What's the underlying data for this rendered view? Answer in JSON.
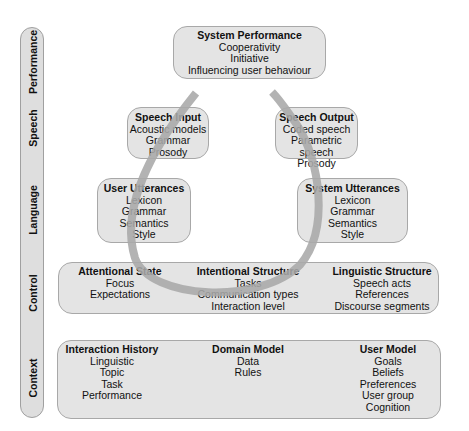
{
  "axis": {
    "levels": [
      "Performance",
      "Speech",
      "Language",
      "Control",
      "Context"
    ]
  },
  "performance": {
    "title": "System Performance",
    "items": [
      "Cooperativity",
      "Initiative",
      "Influencing user behaviour"
    ]
  },
  "speech_input": {
    "title": "Speech Input",
    "items": [
      "Acoustic models",
      "Grammar",
      "Prosody"
    ]
  },
  "speech_output": {
    "title": "Speech Output",
    "items": [
      "Coded speech",
      "Parametric speech",
      "Prosody"
    ]
  },
  "user_utterances": {
    "title": "User Utterances",
    "items": [
      "Lexicon",
      "Grammar",
      "Semantics",
      "Style"
    ]
  },
  "system_utterances": {
    "title": "System Utterances",
    "items": [
      "Lexicon",
      "Grammar",
      "Semantics",
      "Style"
    ]
  },
  "control": {
    "columns": [
      {
        "title": "Attentional State",
        "items": [
          "Focus",
          "Expectations"
        ]
      },
      {
        "title": "Intentional Structure",
        "items": [
          "Tasks",
          "Communication types",
          "Interaction level"
        ]
      },
      {
        "title": "Linguistic Structure",
        "items": [
          "Speech acts",
          "References",
          "Discourse segments"
        ]
      }
    ]
  },
  "context": {
    "columns": [
      {
        "title": "Interaction History",
        "items": [
          "Linguistic",
          "Topic",
          "Task",
          "Performance"
        ]
      },
      {
        "title": "Domain Model",
        "items": [
          "Data",
          "Rules"
        ]
      },
      {
        "title": "User Model",
        "items": [
          "Goals",
          "Beliefs",
          "Preferences",
          "User group",
          "Cognition"
        ]
      }
    ]
  },
  "colors": {
    "box_fill": "#e4e4e4",
    "box_border": "#a8a8a8",
    "arc": "#a9a9a9"
  }
}
